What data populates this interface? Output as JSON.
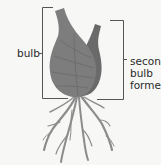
{
  "diagram": {
    "labels": {
      "bulb": "bulb",
      "second_bulb_line1": "second",
      "second_bulb_line2": "bulb",
      "second_bulb_line3": "formed"
    },
    "colors": {
      "background": "#f7f7f5",
      "bulb_fill": "#7c7c7c",
      "bulb_dark": "#5e5e5e",
      "bracket": "#555555",
      "roots": "#8a8a8a"
    }
  }
}
